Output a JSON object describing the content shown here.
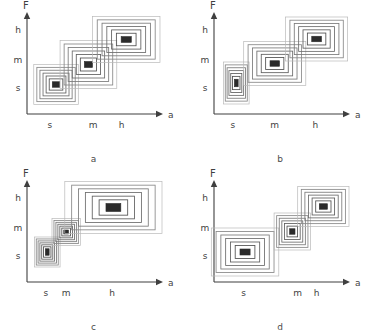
{
  "figure": {
    "type": "contour-panel-grid",
    "background_color": "#ffffff",
    "line_color": "#6e6e6e",
    "core_color": "#2b2b2b",
    "axis_color": "#3f3f3f",
    "panel_count": 4
  },
  "axes_common": {
    "y_axis_label": "F",
    "x_axis_label": "a",
    "y_ticks": [
      "s",
      "m",
      "h"
    ],
    "x_ticks": [
      "s",
      "m",
      "h"
    ]
  },
  "panels": [
    {
      "caption": "a",
      "x_tick_labels": [
        "s",
        "m",
        "h"
      ],
      "y_tick_labels": [
        "s",
        "m",
        "h"
      ],
      "x_tick_positions": [
        0.17,
        0.49,
        0.7
      ],
      "clusters": [
        {
          "name": "small-cluster",
          "cx": 0.215,
          "cy": 0.705,
          "w": 0.33,
          "h": 0.4,
          "rings": 6,
          "core_w": 0.055,
          "core_h": 0.055
        },
        {
          "name": "medium-cluster",
          "cx": 0.455,
          "cy": 0.505,
          "w": 0.42,
          "h": 0.48,
          "rings": 6,
          "core_w": 0.06,
          "core_h": 0.06
        },
        {
          "name": "high-cluster",
          "cx": 0.735,
          "cy": 0.255,
          "w": 0.5,
          "h": 0.46,
          "rings": 6,
          "core_w": 0.075,
          "core_h": 0.058
        }
      ]
    },
    {
      "caption": "b",
      "x_tick_labels": [
        "s",
        "m",
        "h"
      ],
      "y_tick_labels": [
        "s",
        "m",
        "h"
      ],
      "x_tick_positions": [
        0.14,
        0.45,
        0.75
      ],
      "clusters": [
        {
          "name": "small-cluster",
          "cx": 0.165,
          "cy": 0.69,
          "w": 0.19,
          "h": 0.42,
          "rings": 6,
          "core_w": 0.028,
          "core_h": 0.075
        },
        {
          "name": "medium-cluster",
          "cx": 0.45,
          "cy": 0.495,
          "w": 0.46,
          "h": 0.44,
          "rings": 6,
          "core_w": 0.07,
          "core_h": 0.055
        },
        {
          "name": "high-cluster",
          "cx": 0.76,
          "cy": 0.25,
          "w": 0.46,
          "h": 0.44,
          "rings": 6,
          "core_w": 0.072,
          "core_h": 0.055
        }
      ]
    },
    {
      "caption": "c",
      "x_tick_labels": [
        "s",
        "m",
        "h"
      ],
      "y_tick_labels": [
        "s",
        "m",
        "h"
      ],
      "x_tick_positions": [
        0.14,
        0.29,
        0.63
      ],
      "clusters": [
        {
          "name": "small-cluster",
          "cx": 0.15,
          "cy": 0.7,
          "w": 0.19,
          "h": 0.3,
          "rings": 6,
          "core_w": 0.028,
          "core_h": 0.065
        },
        {
          "name": "medium-cluster",
          "cx": 0.29,
          "cy": 0.5,
          "w": 0.21,
          "h": 0.27,
          "rings": 6,
          "core_w": 0.035,
          "core_h": 0.04
        },
        {
          "name": "high-cluster",
          "cx": 0.64,
          "cy": 0.255,
          "w": 0.72,
          "h": 0.52,
          "rings": 6,
          "core_w": 0.11,
          "core_h": 0.08
        }
      ]
    },
    {
      "caption": "d",
      "x_tick_labels": [
        "s",
        "m",
        "h"
      ],
      "y_tick_labels": [
        "s",
        "m",
        "h"
      ],
      "x_tick_positions": [
        0.22,
        0.62,
        0.76
      ],
      "clusters": [
        {
          "name": "small-cluster",
          "cx": 0.23,
          "cy": 0.7,
          "w": 0.5,
          "h": 0.48,
          "rings": 6,
          "core_w": 0.075,
          "core_h": 0.06
        },
        {
          "name": "medium-cluster",
          "cx": 0.58,
          "cy": 0.495,
          "w": 0.27,
          "h": 0.37,
          "rings": 6,
          "core_w": 0.04,
          "core_h": 0.055
        },
        {
          "name": "high-cluster",
          "cx": 0.81,
          "cy": 0.245,
          "w": 0.38,
          "h": 0.4,
          "rings": 6,
          "core_w": 0.06,
          "core_h": 0.055
        }
      ]
    }
  ]
}
